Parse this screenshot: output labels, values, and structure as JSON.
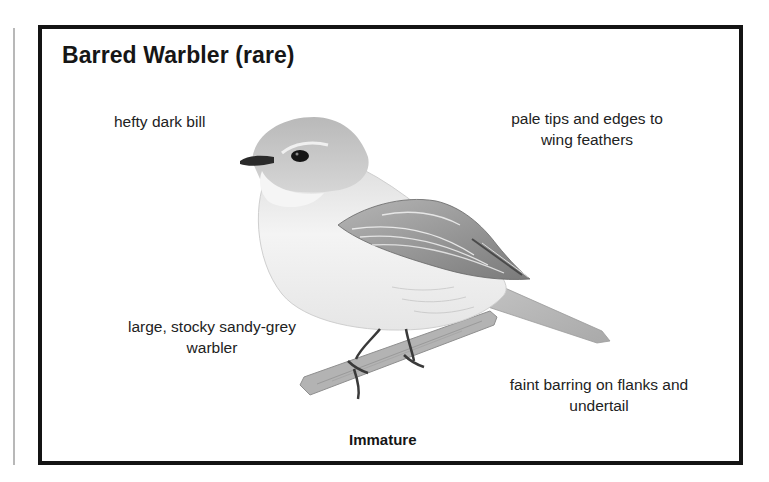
{
  "card": {
    "title": "Barred Warbler (rare)",
    "caption": "Immature",
    "labels": {
      "bill": "hefty dark bill",
      "wing_line1": "pale tips and edges to",
      "wing_line2": "wing feathers",
      "size_line1": "large, stocky sandy-grey",
      "size_line2": "warbler",
      "barring_line1": "faint barring on flanks and",
      "barring_line2": "undertail"
    },
    "illustration": {
      "subject": "bird-illustration",
      "colors": {
        "frame": "#141414",
        "body_light": "#f2f2f2",
        "body_mid": "#d9d9d9",
        "crown": "#bdbdbd",
        "wing_dark": "#6e6e6e",
        "bill": "#2a2a2a",
        "perch": "#a8a8a8"
      }
    }
  }
}
